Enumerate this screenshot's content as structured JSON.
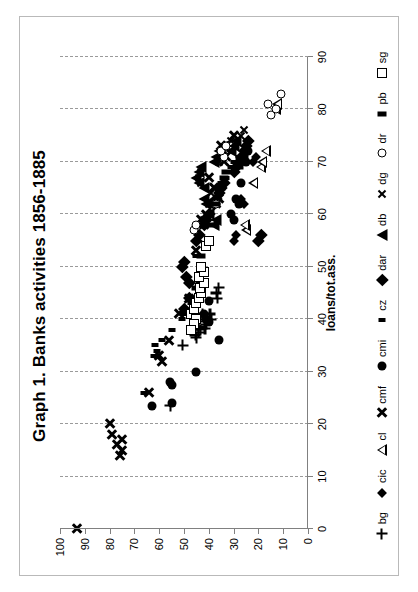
{
  "chart_data": {
    "type": "scatter",
    "title": "Graph 1. Banks activities 1856-1885",
    "xlabel": "loans/tot.ass.",
    "ylabel": "",
    "xlim": [
      0,
      90
    ],
    "ylim": [
      0,
      100
    ],
    "xticks": [
      0,
      10,
      20,
      30,
      40,
      50,
      60,
      70,
      80,
      90
    ],
    "yticks": [
      0,
      10,
      20,
      30,
      40,
      50,
      60,
      70,
      80,
      90,
      100
    ],
    "grid": "vertical-dashed",
    "legend_position": "bottom",
    "orientation_note": "chart is printed rotated 90 degrees counter-clockwise",
    "series": [
      {
        "name": "bg",
        "marker": "plus",
        "points": [
          [
            23.5,
            55.5
          ],
          [
            35,
            50.5
          ],
          [
            38,
            43.5
          ],
          [
            38.2,
            41.5
          ],
          [
            39,
            41
          ],
          [
            40,
            41.8
          ],
          [
            41,
            42.5
          ],
          [
            37.5,
            44
          ],
          [
            38.5,
            44
          ],
          [
            39.5,
            44.3
          ],
          [
            37,
            45.5
          ],
          [
            38,
            45.8
          ],
          [
            44,
            36.5
          ],
          [
            45,
            37
          ],
          [
            46,
            36
          ],
          [
            40,
            39
          ],
          [
            41,
            39.5
          ],
          [
            36.5,
            45
          ]
        ]
      },
      {
        "name": "cic",
        "marker": "small-diamond",
        "points": [
          [
            55,
            30
          ],
          [
            56,
            29
          ],
          [
            62,
            26
          ],
          [
            63,
            27
          ],
          [
            70,
            22
          ],
          [
            71,
            21
          ]
        ]
      },
      {
        "name": "cl",
        "marker": "open-triangle",
        "points": [
          [
            66,
            22
          ],
          [
            69,
            19
          ],
          [
            70,
            18.5
          ],
          [
            57,
            25
          ],
          [
            58,
            25.5
          ],
          [
            72,
            17
          ],
          [
            80,
            13
          ],
          [
            81,
            12.5
          ]
        ]
      },
      {
        "name": "cmf",
        "marker": "heavy-x",
        "points": [
          [
            0,
            93
          ],
          [
            14,
            76
          ],
          [
            15,
            75
          ],
          [
            16,
            77
          ],
          [
            17,
            75
          ],
          [
            18,
            79
          ],
          [
            20,
            80
          ],
          [
            26,
            64
          ],
          [
            32,
            59
          ],
          [
            33,
            60
          ],
          [
            36,
            56
          ],
          [
            41,
            52
          ],
          [
            44,
            48
          ],
          [
            53,
            45
          ],
          [
            58,
            42
          ],
          [
            59,
            43
          ],
          [
            60,
            41
          ],
          [
            62,
            37
          ],
          [
            63,
            36
          ],
          [
            65,
            38
          ],
          [
            67,
            40
          ],
          [
            70,
            34
          ],
          [
            71,
            33
          ],
          [
            73,
            35
          ],
          [
            75,
            30
          ]
        ]
      },
      {
        "name": "cmi",
        "marker": "filled-circle",
        "points": [
          [
            23.5,
            63
          ],
          [
            24,
            55
          ],
          [
            27.5,
            55
          ],
          [
            28,
            55.5
          ],
          [
            30,
            45
          ],
          [
            36,
            36
          ],
          [
            39.5,
            40
          ],
          [
            40,
            41
          ],
          [
            41,
            42
          ],
          [
            43.5,
            40
          ],
          [
            59,
            30
          ],
          [
            60,
            31
          ],
          [
            62,
            28
          ],
          [
            63,
            29
          ],
          [
            66,
            27
          ],
          [
            70,
            25
          ],
          [
            72,
            24
          ]
        ]
      },
      {
        "name": "cz",
        "marker": "small-rect",
        "points": [
          [
            26,
            66
          ],
          [
            33,
            62
          ],
          [
            34,
            61
          ],
          [
            35,
            61.5
          ],
          [
            36,
            59
          ],
          [
            38,
            55
          ],
          [
            40,
            51
          ],
          [
            41,
            50
          ],
          [
            43,
            47
          ],
          [
            47,
            44
          ],
          [
            52,
            45
          ],
          [
            58,
            41
          ],
          [
            62,
            38
          ],
          [
            66,
            35
          ],
          [
            67,
            33
          ],
          [
            68,
            32
          ],
          [
            69,
            31
          ],
          [
            70,
            30
          ],
          [
            71,
            28
          ]
        ]
      },
      {
        "name": "dar",
        "marker": "filled-diamond",
        "points": [
          [
            42,
            50
          ],
          [
            44,
            48
          ],
          [
            47,
            48
          ],
          [
            48,
            49
          ],
          [
            50,
            51
          ],
          [
            51,
            50
          ],
          [
            55,
            45
          ],
          [
            56,
            44
          ],
          [
            58,
            42
          ],
          [
            59,
            41
          ],
          [
            60,
            40
          ],
          [
            62,
            38
          ],
          [
            63,
            37
          ],
          [
            64,
            36
          ],
          [
            65,
            35
          ],
          [
            66,
            34
          ],
          [
            68,
            30
          ],
          [
            69,
            29
          ],
          [
            70,
            28
          ],
          [
            71,
            27
          ],
          [
            72,
            26
          ],
          [
            73,
            25
          ],
          [
            74,
            24
          ],
          [
            55,
            20
          ],
          [
            56,
            19
          ]
        ]
      },
      {
        "name": "db",
        "marker": "filled-triangle",
        "points": [
          [
            60,
            40
          ],
          [
            62,
            41
          ],
          [
            63,
            42
          ],
          [
            65,
            42
          ],
          [
            66,
            44
          ],
          [
            67,
            45
          ],
          [
            68,
            44
          ],
          [
            69,
            43
          ],
          [
            70,
            38
          ],
          [
            71,
            37
          ],
          [
            72,
            36
          ],
          [
            73,
            34
          ],
          [
            58,
            38
          ],
          [
            59,
            37
          ],
          [
            72,
            31
          ],
          [
            73,
            30
          ],
          [
            74,
            29
          ]
        ]
      },
      {
        "name": "dg",
        "marker": "thin-x",
        "points": [
          [
            59,
            42
          ],
          [
            60,
            41
          ],
          [
            62,
            40
          ],
          [
            64,
            39
          ],
          [
            65,
            38
          ],
          [
            66,
            43
          ],
          [
            67,
            44
          ],
          [
            68,
            43
          ],
          [
            70,
            36
          ],
          [
            71,
            35
          ],
          [
            72,
            34
          ],
          [
            73,
            33
          ],
          [
            74,
            31
          ],
          [
            75,
            27
          ],
          [
            76,
            26
          ]
        ]
      },
      {
        "name": "dr",
        "marker": "open-circle",
        "points": [
          [
            57,
            46
          ],
          [
            58,
            45
          ],
          [
            62,
            37
          ],
          [
            71,
            34
          ],
          [
            72,
            35
          ],
          [
            73,
            33
          ],
          [
            79,
            15
          ],
          [
            80,
            13
          ],
          [
            81,
            16
          ],
          [
            83,
            11
          ]
        ]
      },
      {
        "name": "pb",
        "marker": "wide-rect",
        "points": [
          [
            44,
            47
          ],
          [
            46,
            45
          ],
          [
            48,
            44
          ],
          [
            52,
            43
          ],
          [
            58,
            40
          ],
          [
            62,
            37
          ],
          [
            65,
            35
          ],
          [
            67,
            34
          ],
          [
            68,
            33
          ],
          [
            69,
            28
          ],
          [
            70,
            27
          ],
          [
            71,
            26
          ],
          [
            72,
            25
          ]
        ]
      },
      {
        "name": "sg",
        "marker": "open-square",
        "points": [
          [
            41,
            47
          ],
          [
            42,
            46
          ],
          [
            43,
            45
          ],
          [
            44,
            44
          ],
          [
            45,
            43
          ],
          [
            46,
            43.5
          ],
          [
            47,
            42
          ],
          [
            48,
            44
          ],
          [
            49,
            42
          ],
          [
            50,
            43
          ],
          [
            54,
            41
          ],
          [
            55,
            40
          ],
          [
            40,
            45
          ],
          [
            39,
            46
          ],
          [
            38,
            47
          ]
        ]
      }
    ]
  },
  "legend": {
    "items": [
      {
        "label": "bg",
        "marker": "plus"
      },
      {
        "label": "cic",
        "marker": "small-diamond"
      },
      {
        "label": "cl",
        "marker": "open-triangle"
      },
      {
        "label": "cmf",
        "marker": "heavy-x"
      },
      {
        "label": "cmi",
        "marker": "filled-circle"
      },
      {
        "label": "cz",
        "marker": "small-rect"
      },
      {
        "label": "dar",
        "marker": "filled-diamond"
      },
      {
        "label": "db",
        "marker": "filled-triangle"
      },
      {
        "label": "dg",
        "marker": "thin-x"
      },
      {
        "label": "dr",
        "marker": "open-circle"
      },
      {
        "label": "pb",
        "marker": "wide-rect"
      },
      {
        "label": "sg",
        "marker": "open-square"
      }
    ]
  },
  "colors": {
    "marker": "#000000",
    "grid": "#9a9a9a",
    "axis": "#808080",
    "border": "#b9b9b9",
    "background": "#ffffff"
  }
}
